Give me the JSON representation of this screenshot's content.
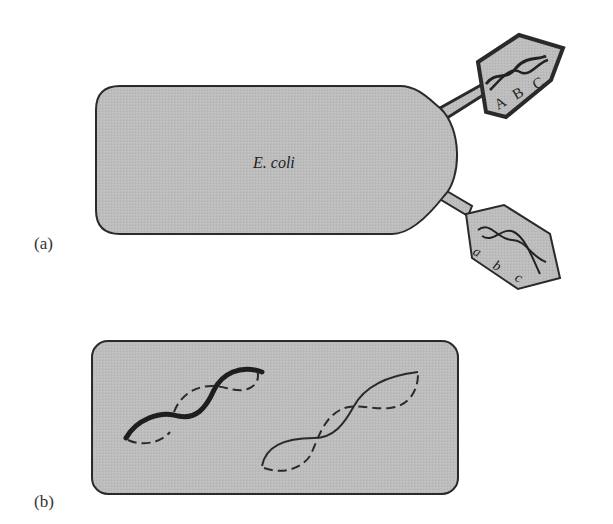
{
  "panels": [
    {
      "id": "a",
      "label": "(a)",
      "cell": {
        "label": "E. coli"
      },
      "phages": [
        {
          "genes": [
            "A",
            "B",
            "C"
          ],
          "dna_style": "thick-twisted"
        },
        {
          "genes": [
            "a",
            "b",
            "c"
          ],
          "dna_style": "thin-twisted"
        }
      ]
    },
    {
      "id": "b",
      "label": "(b)",
      "cell": {
        "label": ""
      },
      "chromosomes": [
        {
          "style": "thick-solid-with-dashed-partner"
        },
        {
          "style": "thin-solid-with-dashed-partner"
        }
      ]
    }
  ],
  "colors": {
    "fill": "#bdbdbd",
    "stroke": "#2a2a2a",
    "background": "#ffffff"
  }
}
